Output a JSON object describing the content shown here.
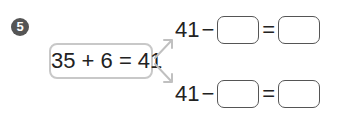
{
  "problem_number": "5",
  "equation": "35 + 6 = 41",
  "rows": [
    {
      "start": "41",
      "minus": "−",
      "equals": "="
    },
    {
      "start": "41",
      "minus": "−",
      "equals": "="
    }
  ],
  "colors": {
    "badge": "#555555",
    "box_border": "#c8c8c8",
    "arrow": "#c0c0c0"
  }
}
